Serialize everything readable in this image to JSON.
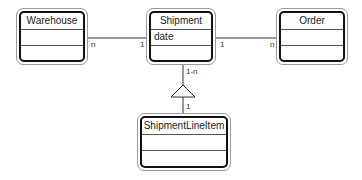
{
  "diagram": {
    "type": "UML class diagram",
    "classes": [
      {
        "id": "warehouse",
        "name": "Warehouse",
        "attributes": [],
        "operations": []
      },
      {
        "id": "shipment",
        "name": "Shipment",
        "attributes": [
          "date"
        ],
        "operations": []
      },
      {
        "id": "order",
        "name": "Order",
        "attributes": [],
        "operations": []
      },
      {
        "id": "shipment_line_item",
        "name": "ShipmentLineItem",
        "attributes": [],
        "operations": []
      }
    ],
    "associations": [
      {
        "from": "Warehouse",
        "to": "Shipment",
        "from_mult": "n",
        "to_mult": "1"
      },
      {
        "from": "Shipment",
        "to": "Order",
        "from_mult": "1",
        "to_mult": "n"
      },
      {
        "from": "Shipment",
        "to": "ShipmentLineItem",
        "from_mult": "1-n",
        "to_mult": "1",
        "symbol": "triangle"
      }
    ],
    "colors": {
      "line": "#333333",
      "outer_border": "#9a9a9a",
      "inner_border": "#111111",
      "background": "#ffffff"
    }
  }
}
